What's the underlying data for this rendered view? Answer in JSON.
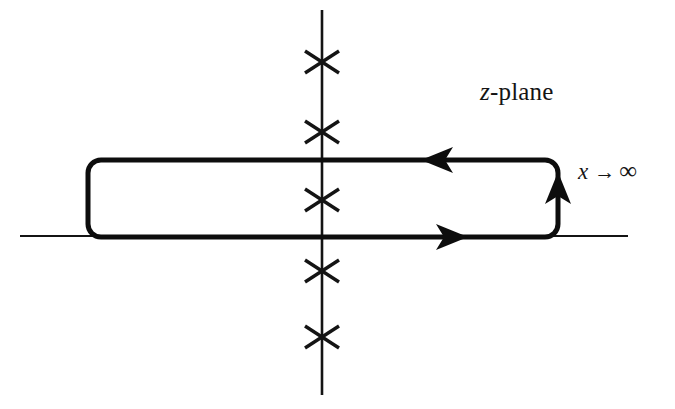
{
  "figure": {
    "background_color": "#ffffff",
    "ink_color": "#141414",
    "width": 675,
    "height": 409
  },
  "labels": {
    "plane_label_variable": "z",
    "plane_label_suffix": "-plane",
    "limit_label_variable": "x",
    "limit_label_arrow": "→",
    "limit_label_target": "∞"
  },
  "axes": {
    "real_axis": {
      "name": "real-axis",
      "x_start": 20,
      "x_end": 628,
      "y": 236,
      "stroke_width": 2.2
    },
    "imaginary_axis": {
      "name": "imaginary-axis",
      "x": 322,
      "y_start": 10,
      "y_end": 395,
      "stroke_width": 2.6
    },
    "origin": {
      "x": 322,
      "y": 236
    }
  },
  "chart_data": {
    "type": "scatter",
    "xlabel": "Re z",
    "ylabel": "Im z",
    "grid": false,
    "legend": null,
    "poles": {
      "marker": "x",
      "count": 5,
      "description": "poles located on the imaginary axis",
      "points": [
        {
          "x": 322,
          "y": 62,
          "half_width": 17,
          "half_height": 11
        },
        {
          "x": 322,
          "y": 132,
          "half_width": 17,
          "half_height": 11
        },
        {
          "x": 322,
          "y": 200,
          "half_width": 17,
          "half_height": 11
        },
        {
          "x": 322,
          "y": 271,
          "half_width": 17,
          "half_height": 11
        },
        {
          "x": 322,
          "y": 337,
          "half_width": 17,
          "half_height": 11
        }
      ]
    },
    "contour": {
      "shape": "rounded-rectangle",
      "left": 88,
      "right": 558,
      "top": 160,
      "bottom": 237,
      "corner_radius": 13,
      "stroke_width": 5,
      "direction": "rightward along bottom, upward on right edge, leftward along top",
      "arrows": [
        {
          "name": "bottom-edge-arrow",
          "x": 452,
          "y": 237,
          "direction": "right"
        },
        {
          "name": "right-edge-arrow",
          "x": 558,
          "y": 188,
          "direction": "up"
        },
        {
          "name": "top-edge-arrow",
          "x": 437,
          "y": 160,
          "direction": "left"
        }
      ]
    }
  }
}
